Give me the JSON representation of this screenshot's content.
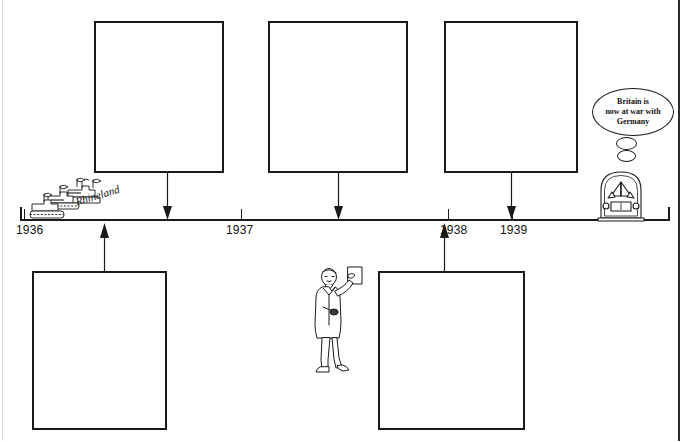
{
  "page": {
    "type": "worksheet-timeline",
    "title_visible": false,
    "background": "#ffffff",
    "ink": "#1a1a1a"
  },
  "timeline": {
    "axis_start_year": 1936,
    "axis_end_year": 1939,
    "years": [
      {
        "label": "1936",
        "x": 16,
        "tick_x": 24
      },
      {
        "label": "1937",
        "x": 225,
        "tick_x": 241
      },
      {
        "label": "1938",
        "x": 441,
        "tick_x": 448
      },
      {
        "label": "1939",
        "x": 498,
        "tick_x": 512
      }
    ]
  },
  "boxes": {
    "top": [
      {
        "name": "answer-box-top-1",
        "text": "",
        "x": 94,
        "y": 21,
        "w": 130,
        "h": 152
      },
      {
        "name": "answer-box-top-2",
        "text": "",
        "x": 268,
        "y": 21,
        "w": 140,
        "h": 152
      },
      {
        "name": "answer-box-top-3",
        "text": "",
        "x": 444,
        "y": 21,
        "w": 134,
        "h": 152
      }
    ],
    "bottom": [
      {
        "name": "answer-box-bottom-1",
        "text": "",
        "x": 32,
        "y": 271,
        "w": 135,
        "h": 159
      },
      {
        "name": "answer-box-bottom-2",
        "text": "",
        "x": 378,
        "y": 271,
        "w": 147,
        "h": 159
      }
    ]
  },
  "arrows": [
    {
      "name": "arrow-down-1936-event",
      "direction": "down",
      "x": 167,
      "from_y": 173,
      "to_y": 218
    },
    {
      "name": "arrow-down-1937-event",
      "direction": "down",
      "x": 338,
      "from_y": 173,
      "to_y": 218
    },
    {
      "name": "arrow-down-1939-event",
      "direction": "down",
      "x": 511,
      "from_y": 173,
      "to_y": 218
    },
    {
      "name": "arrow-up-rhineland",
      "direction": "up",
      "x": 104,
      "from_y": 271,
      "to_y": 222
    },
    {
      "name": "arrow-up-munich",
      "direction": "up",
      "x": 444,
      "from_y": 271,
      "to_y": 222
    }
  ],
  "illustrations": {
    "tanks": {
      "name": "tanks-illustration",
      "caption": "Rhineland",
      "description": "German tanks with pennants rolling into the Rhineland",
      "x": 22,
      "y": 178
    },
    "chamberlain": {
      "name": "man-with-paper-illustration",
      "description": "Man in overcoat holding up a sheet of paper",
      "x": 308,
      "y": 265
    },
    "radio": {
      "name": "radio-illustration",
      "description": "Vintage arched wireless radio set",
      "x": 596,
      "y": 170,
      "speech_bubble": {
        "name": "radio-speech-bubble",
        "lines": [
          "Britain is",
          "now at war with",
          "Germany"
        ],
        "text": "Britain is now at war with Germany"
      }
    }
  }
}
